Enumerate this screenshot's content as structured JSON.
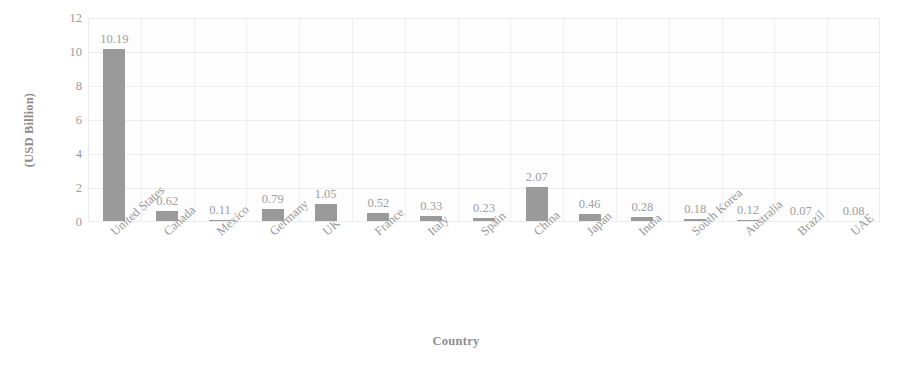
{
  "chart_data": {
    "type": "bar",
    "title": "",
    "xlabel": "Country",
    "ylabel": "(USD Billion)",
    "ylim": [
      0,
      12
    ],
    "yticks": [
      12,
      10,
      8,
      6,
      4,
      2,
      0
    ],
    "grid": true,
    "legend": "none",
    "categories": [
      "United States",
      "Canada",
      "Mexico",
      "Germany",
      "UK",
      "France",
      "Italy",
      "Spain",
      "China",
      "Japan",
      "India",
      "South Korea",
      "Australia",
      "Brazil",
      "UAE"
    ],
    "values": [
      10.19,
      0.62,
      0.11,
      0.79,
      1.05,
      0.52,
      0.33,
      0.23,
      2.07,
      0.46,
      0.28,
      0.18,
      0.12,
      0.07,
      0.08
    ],
    "data_labels": [
      "10.19",
      "0.62",
      "0.11",
      "0.79",
      "1.05",
      "0.52",
      "0.33",
      "0.23",
      "2.07",
      "0.46",
      "0.28",
      "0.18",
      "0.12",
      "0.07",
      "0.08"
    ],
    "bar_color": "#9a9a9a",
    "grid_color": "#ededed",
    "text_color": "#9a9a9a"
  }
}
